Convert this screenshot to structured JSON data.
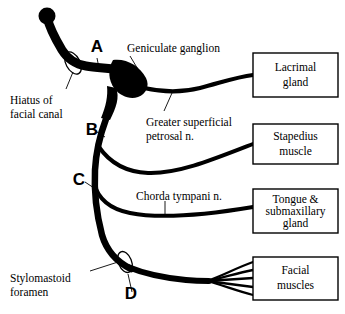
{
  "figure": {
    "type": "anatomical-diagram",
    "background_color": "#ffffff",
    "stroke_color": "#000000"
  },
  "letter_markers": [
    {
      "label": "A",
      "x": 97,
      "y": 52
    },
    {
      "label": "B",
      "x": 92,
      "y": 135
    },
    {
      "label": "C",
      "x": 79,
      "y": 185
    },
    {
      "label": "D",
      "x": 131,
      "y": 299
    }
  ],
  "structure_labels": [
    {
      "name": "hiatus-of-facial-canal",
      "lines": [
        "Hiatus of",
        "facial canal"
      ],
      "x": 10,
      "y": 95
    },
    {
      "name": "geniculate-ganglion",
      "lines": [
        "Geniculate ganglion"
      ],
      "x": 127,
      "y": 48
    },
    {
      "name": "greater-superficial-petrosal-nerve",
      "lines": [
        "Greater superficial",
        "petrosal n."
      ],
      "x": 146,
      "y": 118
    },
    {
      "name": "chorda-tympani-nerve",
      "lines": [
        "Chorda tympani n."
      ],
      "x": 136,
      "y": 196
    },
    {
      "name": "stylomastoid-foramen",
      "lines": [
        "Stylomastoid",
        "foramen"
      ],
      "x": 10,
      "y": 277
    }
  ],
  "target_boxes": [
    {
      "name": "lacrimal-gland",
      "lines": [
        "Lacrimal",
        "gland"
      ],
      "x": 253,
      "y": 53,
      "width": 85,
      "height": 44
    },
    {
      "name": "stapedius-muscle",
      "lines": [
        "Stapedius",
        "muscle"
      ],
      "x": 253,
      "y": 124,
      "width": 85,
      "height": 40
    },
    {
      "name": "tongue-and-submaxillary-gland",
      "lines": [
        "Tongue &",
        "submaxillary",
        "gland"
      ],
      "x": 253,
      "y": 189,
      "width": 85,
      "height": 44
    },
    {
      "name": "facial-muscles",
      "lines": [
        "Facial",
        "muscles"
      ],
      "x": 253,
      "y": 257,
      "width": 85,
      "height": 43
    }
  ],
  "foramen_markers": [
    {
      "name": "hiatus-of-facial-canal-marker",
      "cx": 73,
      "cy": 63,
      "rx": 7,
      "ry": 12,
      "rotation": -28
    },
    {
      "name": "stylomastoid-foramen-marker",
      "cx": 125,
      "cy": 262,
      "rx": 6.5,
      "ry": 11,
      "rotation": -22
    }
  ]
}
